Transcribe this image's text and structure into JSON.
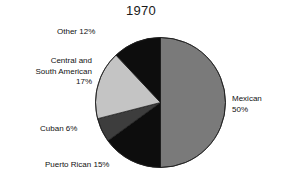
{
  "chart_data": {
    "type": "pie",
    "title": "1970",
    "xlabel": "",
    "ylabel": "",
    "legend_position": "none",
    "grid": false,
    "categories": [
      "Mexican",
      "Puerto Rican",
      "Cuban",
      "Central and South American",
      "Other"
    ],
    "values": [
      50,
      15,
      6,
      17,
      12
    ],
    "units": "percent",
    "start_angle_deg": 0,
    "direction": "clockwise",
    "slices": [
      {
        "name": "Mexican",
        "value": 50,
        "label": "Mexican",
        "percent_label": "50%",
        "color": "#7a7a7a",
        "start_deg": 0,
        "end_deg": 180
      },
      {
        "name": "Puerto Rican",
        "value": 15,
        "label": "Puerto Rican 15%",
        "percent_label": "15%",
        "color": "#0d0d0d",
        "start_deg": 180,
        "end_deg": 234
      },
      {
        "name": "Cuban",
        "value": 6,
        "label": "Cuban 6%",
        "percent_label": "6%",
        "color": "#3d3d3d",
        "start_deg": 234,
        "end_deg": 255.6
      },
      {
        "name": "Central and South American",
        "value": 17,
        "label_line1": "Central and",
        "label_line2": "South American",
        "label_line3": "17%",
        "percent_label": "17%",
        "color": "#c4c4c4",
        "start_deg": 255.6,
        "end_deg": 316.8
      },
      {
        "name": "Other",
        "value": 12,
        "label": "Other 12%",
        "percent_label": "12%",
        "color": "#0d0d0d",
        "start_deg": 316.8,
        "end_deg": 360
      }
    ]
  },
  "figure": {
    "title": "1970",
    "background_color": "#ffffff",
    "text_color": "#111111"
  },
  "labels": {
    "other": "Other 12%",
    "central_south_american_line1": "Central and",
    "central_south_american_line2": "South American",
    "central_south_american_line3": "17%",
    "cuban": "Cuban 6%",
    "puerto_rican": "Puerto Rican 15%",
    "mexican_line1": "Mexican",
    "mexican_line2": "50%"
  }
}
